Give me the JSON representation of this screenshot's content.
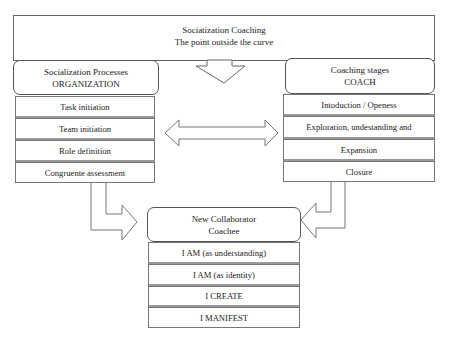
{
  "title_box": {
    "line1": "Sociatization Coaching",
    "line2": "The point outside the curve"
  },
  "organization": {
    "header_line1": "Socialization Processes",
    "header_line2": "ORGANIZATION",
    "items": [
      "Task initiation",
      "Team initiation",
      "Role definition",
      "Congruente assessment"
    ]
  },
  "coach": {
    "header_line1": "Coaching stages",
    "header_line2": "COACH",
    "items": [
      "Intoduction / Openess",
      "Exploration, undestanding  and",
      "Expansion",
      "Closure"
    ]
  },
  "coachee": {
    "header_line1": "New Collaborator",
    "header_line2": "Coachee",
    "items": [
      "I AM (as understanding)",
      "I AM (as identity)",
      "I CREATE",
      "I MANIFEST"
    ]
  },
  "arrows": {
    "down_from_title": "down-arrow",
    "between_columns": "double-horizontal-arrow",
    "org_to_coachee": "bent-right-arrow",
    "coach_to_coachee": "bent-left-arrow"
  },
  "colors": {
    "stroke": "#666666",
    "background": "#ffffff",
    "text": "#222222"
  }
}
